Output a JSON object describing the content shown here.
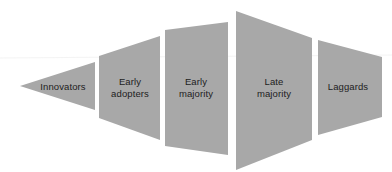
{
  "diagram": {
    "name": "innovation-adoption-funnel",
    "type": "segmented-polygon-diagram",
    "background_color": "#ffffff",
    "segment_fill_color": "#a8a8a8",
    "label_color": "#1d1d1d",
    "scan_line_color": "#e2e2e2",
    "canvas": {
      "width": 392,
      "height": 172
    },
    "segments": [
      {
        "id": "innovators",
        "label": "Innovators",
        "shape": "left-pointing-triangle",
        "points": "20,86 95,62 95,110",
        "label_x": 63,
        "label_y": 87
      },
      {
        "id": "early-adopters",
        "label": "Early\nadopters",
        "shape": "trapezoid",
        "points": "99,56 160,36 160,140 99,118",
        "label_x": 130,
        "label_y": 87
      },
      {
        "id": "early-majority",
        "label": "Early\nmajority",
        "shape": "trapezoid",
        "points": "165,30 228,22 228,155 165,146",
        "label_x": 196,
        "label_y": 87
      },
      {
        "id": "late-majority",
        "label": "Late\nmajority",
        "shape": "trapezoid",
        "points": "236,11 312,38 312,140 236,170",
        "label_x": 274,
        "label_y": 87
      },
      {
        "id": "laggards",
        "label": "Laggards",
        "shape": "right-pointing-trapezoid",
        "points": "318,40 382,57 382,117 318,135",
        "label_x": 348,
        "label_y": 87
      }
    ],
    "scan_line": {
      "x1": 0,
      "y1": 58,
      "x2": 392,
      "y2": 55
    }
  }
}
